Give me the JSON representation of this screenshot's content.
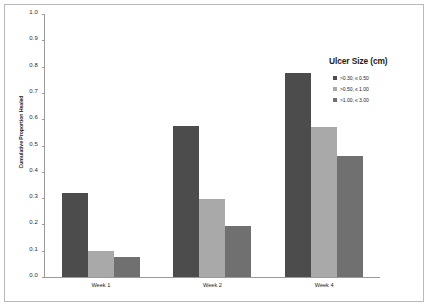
{
  "chart_data": {
    "type": "bar",
    "title": "",
    "xlabel": "",
    "ylabel": "Cumulative Proportion Healed",
    "ylim": [
      0.0,
      1.0
    ],
    "grid": false,
    "legend_position": "right",
    "legend_title": "Ulcer Size (cm)",
    "categories": [
      "Week 1",
      "Week 2",
      "Week 4"
    ],
    "yticks": [
      "0.0",
      "0.1",
      "0.2",
      "0.3",
      "0.4",
      "0.5",
      "0.6",
      "0.7",
      "0.8",
      "0.9",
      "1.0"
    ],
    "ytick_values": [
      0.0,
      0.1,
      0.2,
      0.3,
      0.4,
      0.5,
      0.6,
      0.7,
      0.8,
      0.9,
      1.0
    ],
    "series": [
      {
        "name": ">0.30, ≤ 0.50",
        "color": "#4c4c4c",
        "values": [
          0.32,
          0.575,
          0.775
        ]
      },
      {
        "name": ">0.50, ≤ 1.00",
        "color": "#a9a9a9",
        "values": [
          0.098,
          0.295,
          0.572
        ]
      },
      {
        "name": ">1.00, ≤ 3.00",
        "color": "#707070",
        "values": [
          0.078,
          0.195,
          0.462
        ]
      }
    ]
  },
  "colors": {
    "axis": "#9a9a9a",
    "frame": "#b9b9b9",
    "text": "#1d1d1d",
    "background": "#ffffff"
  }
}
